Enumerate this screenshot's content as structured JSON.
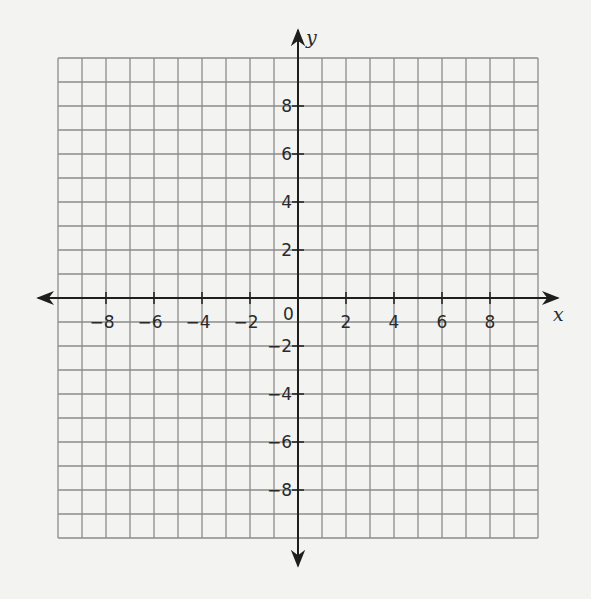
{
  "chart_data": {
    "type": "scatter",
    "title": "",
    "subtitle": "",
    "xlabel": "x",
    "ylabel": "y",
    "xlim": [
      -10,
      10
    ],
    "ylim": [
      -10,
      10
    ],
    "grid": true,
    "grid_step": 1,
    "legend": null,
    "x_ticks": [
      -8,
      -6,
      -4,
      -2,
      2,
      4,
      6,
      8
    ],
    "y_ticks": [
      -8,
      -6,
      -4,
      -2,
      2,
      4,
      6,
      8
    ],
    "x_tick_labels": [
      "-8",
      "-6",
      "-4",
      "-2",
      "2",
      "4",
      "6",
      "8"
    ],
    "y_tick_labels": [
      "8",
      "6",
      "4",
      "2",
      "-2",
      "-4",
      "-6",
      "-8"
    ],
    "origin_label": "0",
    "series": [],
    "annotations": []
  },
  "colors": {
    "background": "#f3f3f2",
    "grid": "#8c8c8c",
    "axis": "#1e1e1e",
    "text": "#2a2a2a"
  }
}
